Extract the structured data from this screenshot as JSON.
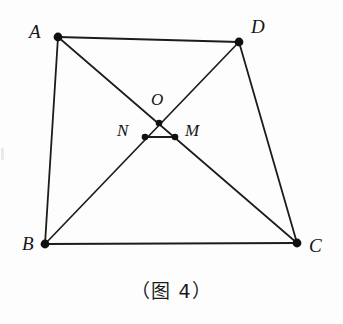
{
  "figure": {
    "caption": "（图 4）",
    "caption_name": "figure-4-caption",
    "background_color": "#fdfdfd",
    "stroke_color": "#1c1c1c",
    "dot_color": "#101010"
  },
  "points": {
    "A": {
      "label": "A",
      "x": 58,
      "y": 37,
      "label_x": 29,
      "label_y": 22
    },
    "D": {
      "label": "D",
      "x": 239,
      "y": 42,
      "label_x": 251,
      "label_y": 17
    },
    "B": {
      "label": "B",
      "x": 45,
      "y": 244,
      "label_x": 22,
      "label_y": 234
    },
    "C": {
      "label": "C",
      "x": 297,
      "y": 243,
      "label_x": 309,
      "label_y": 236
    },
    "O": {
      "label": "O",
      "x": 159,
      "y": 123,
      "label_x": 151,
      "label_y": 91
    },
    "N": {
      "label": "N",
      "x": 145,
      "y": 137,
      "label_x": 117,
      "label_y": 122
    },
    "M": {
      "label": "M",
      "x": 175,
      "y": 137,
      "label_x": 185,
      "label_y": 122
    }
  },
  "segments": [
    {
      "name": "segment-AD",
      "from": "A",
      "to": "D",
      "width": 2.2
    },
    {
      "name": "segment-AB",
      "from": "A",
      "to": "B",
      "width": 1.8
    },
    {
      "name": "segment-BC",
      "from": "B",
      "to": "C",
      "width": 2.0
    },
    {
      "name": "segment-DC",
      "from": "D",
      "to": "C",
      "width": 1.8
    },
    {
      "name": "segment-A-to-C-through-O-M",
      "from": "A",
      "to": "C",
      "width": 1.7
    },
    {
      "name": "segment-B-to-D-through-N-O",
      "from": "B",
      "to": "D",
      "width": 1.7
    },
    {
      "name": "segment-NM",
      "from": "N",
      "to": "M",
      "width": 1.9
    }
  ],
  "dot_radius": {
    "vertex": 4.2,
    "inner": 3.2
  }
}
